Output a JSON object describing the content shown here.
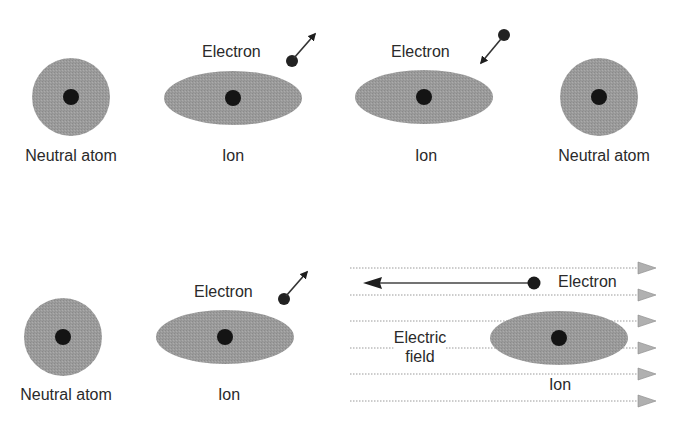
{
  "colors": {
    "cloud": "#9a9a9a",
    "nucleus": "#141414",
    "electron": "#222222",
    "text": "#2a2a2a",
    "field_line": "#9a9a9a",
    "field_arrowhead": "#b0b0b0"
  },
  "panel_top": {
    "items": [
      {
        "label": "Neutral atom",
        "type": "atom"
      },
      {
        "label": "Ion",
        "type": "ion",
        "electron_label": "Electron",
        "electron_motion": "leaving"
      },
      {
        "label": "Ion",
        "type": "ion",
        "electron_label": "Electron",
        "electron_motion": "approaching"
      },
      {
        "label": "Neutral atom",
        "type": "atom"
      }
    ]
  },
  "panel_bottom_left": {
    "items": [
      {
        "label": "Neutral atom",
        "type": "atom"
      },
      {
        "label": "Ion",
        "type": "ion",
        "electron_label": "Electron",
        "electron_motion": "leaving"
      }
    ]
  },
  "panel_bottom_right": {
    "electron_label": "Electron",
    "field_label_line1": "Electric",
    "field_label_line2": "field",
    "ion_label": "Ion",
    "field_line_count": 6,
    "field_direction": "right",
    "electron_direction": "left"
  }
}
